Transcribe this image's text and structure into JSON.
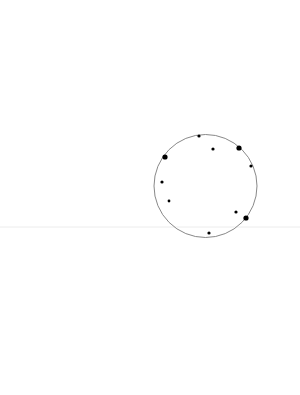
{
  "canvas": {
    "width": 300,
    "height": 395,
    "background": "#ffffff"
  },
  "horizon_line": {
    "y": 227,
    "color": "#ececec"
  },
  "circle": {
    "cx": 205.5,
    "cy": 186,
    "r": 51.5,
    "stroke": "#7a7a7a"
  },
  "dots": [
    {
      "x": 199,
      "y": 136,
      "r": 1.6
    },
    {
      "x": 213,
      "y": 149,
      "r": 1.6
    },
    {
      "x": 239,
      "y": 148,
      "r": 2.6
    },
    {
      "x": 165,
      "y": 157,
      "r": 2.6
    },
    {
      "x": 251,
      "y": 166,
      "r": 1.6
    },
    {
      "x": 162,
      "y": 182,
      "r": 1.6
    },
    {
      "x": 169,
      "y": 201,
      "r": 1.4
    },
    {
      "x": 236,
      "y": 212,
      "r": 1.6
    },
    {
      "x": 246,
      "y": 218,
      "r": 2.6
    },
    {
      "x": 209,
      "y": 233,
      "r": 1.6
    }
  ],
  "dot_color": "#000000"
}
